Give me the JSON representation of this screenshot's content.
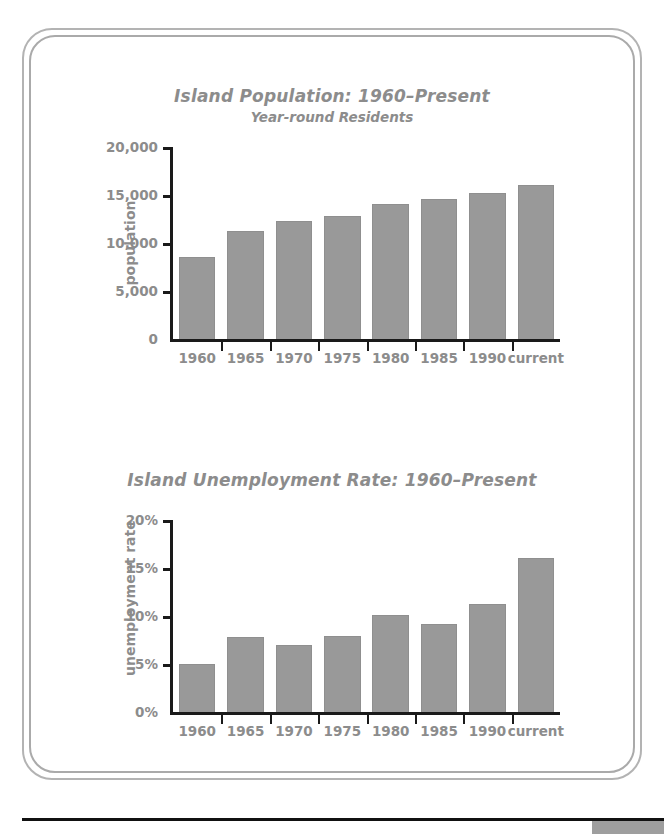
{
  "document": {
    "bottom_rule_color": "#111111",
    "corner_block_color": "#9e9e9e",
    "frame_color": "#b3b3b3",
    "text_color": "#8c8c8c",
    "bar_color": "#999999"
  },
  "charts": [
    {
      "title": "Island Population: 1960–Present",
      "subtitle": "Year-round Residents",
      "ylabel": "population",
      "ytick_labels": [
        "0",
        "5,000",
        "10,000",
        "15,000",
        "20,000"
      ]
    },
    {
      "title": "Island Unemployment Rate: 1960–Present",
      "subtitle": "",
      "ylabel": "unemployment rate",
      "ytick_labels": [
        "0%",
        "5%",
        "10%",
        "15%",
        "20%"
      ]
    }
  ],
  "chart_data": [
    {
      "type": "bar",
      "title": "Island Population: 1960–Present",
      "subtitle": "Year-round Residents",
      "xlabel": "",
      "ylabel": "population",
      "categories": [
        "1960",
        "1965",
        "1970",
        "1975",
        "1980",
        "1985",
        "1990",
        "current"
      ],
      "values": [
        8500,
        11200,
        12300,
        12800,
        14100,
        14600,
        15200,
        16000
      ],
      "ylim": [
        0,
        20000
      ],
      "yticks": [
        0,
        5000,
        10000,
        15000,
        20000
      ],
      "ytick_labels": [
        "0",
        "5,000",
        "10,000",
        "15,000",
        "20,000"
      ],
      "grid": false,
      "legend": false
    },
    {
      "type": "bar",
      "title": "Island Unemployment Rate: 1960–Present",
      "subtitle": "",
      "xlabel": "",
      "ylabel": "unemployment rate",
      "categories": [
        "1960",
        "1965",
        "1970",
        "1975",
        "1980",
        "1985",
        "1990",
        "current"
      ],
      "values": [
        5.0,
        7.8,
        7.0,
        7.9,
        10.1,
        9.2,
        11.2,
        16.0
      ],
      "ylim": [
        0,
        20
      ],
      "yticks": [
        0,
        5,
        10,
        15,
        20
      ],
      "ytick_labels": [
        "0%",
        "5%",
        "10%",
        "15%",
        "20%"
      ],
      "grid": false,
      "legend": false
    }
  ]
}
